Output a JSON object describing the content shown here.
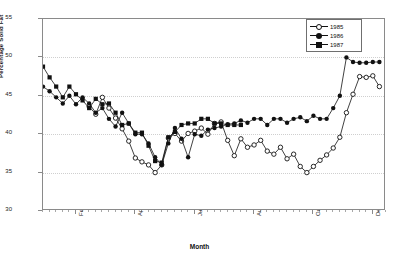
{
  "chart_data": {
    "type": "line",
    "title": "",
    "xlabel": "Month",
    "ylabel": "Percentage Solid Fat",
    "ylim": [
      30,
      55
    ],
    "yticks": [
      30,
      35,
      40,
      45,
      50,
      55
    ],
    "grid": true,
    "legend_position": "top-right",
    "x_tick_labels": [
      "Feb",
      "Apr",
      "Jun",
      "Aug",
      "Oct",
      "Dec"
    ],
    "x_tick_positions": [
      6,
      15,
      24,
      33,
      42,
      51
    ],
    "x_count": 53,
    "series": [
      {
        "name": "1985",
        "marker": "open-circle",
        "color": "#111111",
        "x": [
          8,
          9,
          10,
          11,
          12,
          13,
          14,
          15,
          16,
          17,
          18,
          19,
          20,
          21,
          22,
          23,
          24,
          25,
          26,
          27,
          28,
          29,
          30,
          31,
          32,
          33,
          34,
          35,
          36,
          37,
          38,
          39,
          40,
          41,
          42,
          43,
          44,
          45,
          46,
          47,
          48,
          49,
          50,
          51,
          52
        ],
        "values": [
          43.6,
          42.6,
          44.8,
          43.4,
          42.1,
          40.7,
          39.1,
          36.9,
          36.4,
          36.0,
          35.0,
          36.0,
          39.5,
          40.1,
          39.1,
          40.1,
          40.4,
          40.8,
          40.0,
          41.4,
          41.6,
          39.2,
          37.2,
          39.4,
          38.3,
          38.6,
          39.2,
          37.8,
          37.4,
          38.3,
          36.8,
          37.4,
          35.8,
          35.0,
          35.8,
          36.6,
          37.3,
          38.2,
          39.6,
          42.8,
          45.2,
          47.5,
          47.4,
          47.6,
          46.2
        ]
      },
      {
        "name": "1986",
        "marker": "filled-circle",
        "color": "#111111",
        "x": [
          1,
          2,
          3,
          4,
          5,
          6,
          7,
          8,
          9,
          10,
          11,
          12,
          13,
          14,
          15,
          16,
          17,
          18,
          19,
          20,
          21,
          22,
          23,
          24,
          25,
          26,
          27,
          28,
          29,
          30,
          31,
          32,
          33,
          34,
          35,
          36,
          37,
          38,
          39,
          40,
          41,
          42,
          43,
          44,
          45,
          46,
          47,
          48,
          49,
          50,
          51,
          52
        ],
        "values": [
          46.2,
          45.6,
          44.8,
          44.0,
          45.0,
          43.9,
          44.8,
          44.0,
          42.8,
          43.4,
          42.0,
          41.0,
          42.8,
          41.4,
          40.0,
          40.0,
          38.8,
          37.0,
          36.0,
          38.8,
          40.8,
          39.4,
          37.0,
          40.0,
          39.8,
          40.6,
          40.8,
          41.0,
          41.3,
          41.4,
          41.8,
          41.5,
          42.0,
          42.0,
          41.2,
          42.0,
          42.0,
          41.5,
          42.0,
          42.2,
          41.7,
          42.4,
          42.0,
          42.0,
          43.4,
          45.0,
          50.0,
          49.4,
          49.3,
          49.3,
          49.4,
          49.4
        ]
      },
      {
        "name": "1987",
        "marker": "filled-square",
        "color": "#111111",
        "x": [
          1,
          2,
          3,
          4,
          5,
          6,
          7,
          8,
          9,
          10,
          11,
          12,
          13,
          14,
          15,
          16,
          17,
          18,
          19,
          20,
          21,
          22,
          23,
          24,
          25,
          26,
          27,
          28,
          29,
          30,
          31
        ],
        "values": [
          48.8,
          47.4,
          46.2,
          44.8,
          46.2,
          45.2,
          44.4,
          43.4,
          44.6,
          43.9,
          44.0,
          42.8,
          41.2,
          41.4,
          40.2,
          40.2,
          38.5,
          36.5,
          36.3,
          39.6,
          40.3,
          41.2,
          41.4,
          41.4,
          42.0,
          42.0,
          41.4,
          41.4,
          41.2,
          41.2,
          41.2
        ]
      }
    ]
  },
  "legend": {
    "title": "",
    "entries": [
      {
        "label": "1985",
        "marker": "open-circle"
      },
      {
        "label": "1986",
        "marker": "filled-circle"
      },
      {
        "label": "1987",
        "marker": "filled-square"
      }
    ]
  },
  "axes": {
    "y_title": "Percentage Solid Fat",
    "x_title": "Month",
    "y_tick_labels": [
      "30",
      "35",
      "40",
      "45",
      "50",
      "55"
    ],
    "x_tick_labels": [
      "Feb",
      "Apr",
      "Jun",
      "Aug",
      "Oct",
      "Dec"
    ]
  },
  "colors": {
    "ink": "#111111",
    "frame": "#8a8a8a",
    "grid": "#cfcfcf",
    "background": "#ffffff"
  }
}
